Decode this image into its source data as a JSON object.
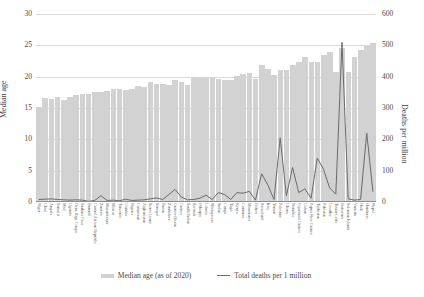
{
  "chart_data": {
    "type": "bar",
    "title": "",
    "xlabel": "",
    "ylabel": "Median age",
    "y2label": "Deaths per million",
    "ylim": [
      0,
      30
    ],
    "y2lim": [
      0,
      600
    ],
    "yticks": [
      0,
      5,
      10,
      15,
      20,
      25,
      30
    ],
    "y2ticks": [
      0,
      100,
      200,
      300,
      400,
      500,
      600
    ],
    "grid": true,
    "legend_position": "bottom",
    "legend": [
      "Median age (as of 2020)",
      "Total deaths per 1 million"
    ],
    "categories": [
      "Niger",
      "Chad",
      "Angola",
      "Somalia",
      "Mali",
      "Uganda",
      "Dem. Rep. Congo",
      "Burkina Faso",
      "Burundi",
      "Central African Republic",
      "Zambia",
      "Mozambique",
      "Malawi",
      "Tanzania",
      "Gambia",
      "Nigeria",
      "Cameroon",
      "Afghanistan",
      "Sierra Leone",
      "Senegal",
      "Benin",
      "Zimbabwe",
      "Guinea-Bissau",
      "Guinea",
      "South Sudan",
      "Rwanda",
      "Ethiopia",
      "Liberia",
      "Madagascar",
      "Sudan",
      "Congo",
      "Togo",
      "Kenya",
      "Comoros",
      "Mauritania",
      "Eritrea",
      "Swaziland",
      "Iraq",
      "Yemen",
      "Palestine",
      "Ghana",
      "Namibia",
      "Equatorial Guinea",
      "Gabon",
      "Papua New Guinea",
      "Tajikistan",
      "Pakistan",
      "Lesotho",
      "Timor-Leste",
      "Botswana",
      "Solomon Islands",
      "Vanuatu",
      "Haiti",
      "Honduras",
      "Nepal"
    ],
    "series": [
      {
        "name": "Median age (as of 2020)",
        "axis": "left",
        "type": "bar",
        "color": "#d2d2d2",
        "values": [
          15.2,
          16.6,
          16.4,
          16.8,
          16.3,
          16.7,
          17.0,
          17.3,
          17.3,
          17.6,
          17.6,
          17.7,
          18.1,
          18.0,
          17.8,
          18.1,
          18.5,
          18.4,
          19.1,
          18.8,
          18.8,
          18.7,
          19.4,
          19.1,
          18.6,
          20.0,
          19.8,
          19.8,
          19.9,
          19.7,
          19.4,
          19.4,
          20.1,
          20.4,
          20.6,
          19.7,
          21.8,
          21.2,
          20.2,
          21.0,
          21.1,
          21.8,
          22.4,
          23.1,
          22.4,
          22.4,
          23.5,
          24.0,
          20.8,
          24.5,
          20.7,
          23.1,
          24.3,
          24.9,
          25.3
        ]
      },
      {
        "name": "Total deaths per 1 million",
        "axis": "right",
        "type": "line",
        "color": "#6a6a6a",
        "values": [
          8,
          9,
          10,
          8,
          7,
          6,
          7,
          6,
          2,
          5,
          20,
          5,
          6,
          4,
          9,
          5,
          6,
          7,
          10,
          13,
          8,
          24,
          40,
          16,
          7,
          8,
          12,
          22,
          8,
          30,
          24,
          8,
          30,
          28,
          34,
          6,
          90,
          55,
          8,
          205,
          20,
          110,
          30,
          42,
          12,
          140,
          105,
          45,
          25,
          510,
          10,
          6,
          8,
          220,
          34
        ]
      }
    ]
  },
  "axes": {
    "left_label": "Median age",
    "right_label": "Deaths per million"
  }
}
